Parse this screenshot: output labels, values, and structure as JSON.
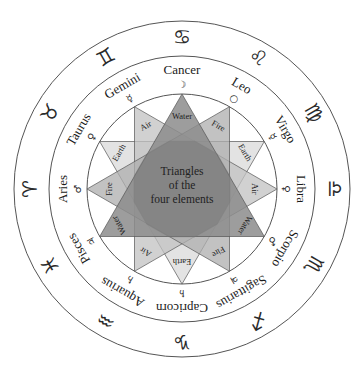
{
  "diagram": {
    "center_title_lines": [
      "Triangles",
      "of the",
      "four elements"
    ],
    "colors": {
      "ring_stroke": "#555555",
      "water": "#8c8c8c",
      "fire": "#adadad",
      "air": "#c2c2c2",
      "earth": "#dadada",
      "overlap": "#7a7a7a"
    },
    "signs": [
      {
        "name": "Cancer",
        "planet": "☽",
        "zodiac": "♋",
        "angle": 0
      },
      {
        "name": "Leo",
        "planet": "○",
        "zodiac": "♌",
        "angle": 30
      },
      {
        "name": "Virgo",
        "planet": "☿",
        "zodiac": "♍",
        "angle": 60
      },
      {
        "name": "Libra",
        "planet": "♀",
        "zodiac": "♎",
        "angle": 90
      },
      {
        "name": "Scorpio",
        "planet": "♂",
        "zodiac": "♏",
        "angle": 120
      },
      {
        "name": "Sagittarius",
        "planet": "♃",
        "zodiac": "♐",
        "angle": 150
      },
      {
        "name": "Capricorn",
        "planet": "♄",
        "zodiac": "♑",
        "angle": 180
      },
      {
        "name": "Aquarius",
        "planet": "♄",
        "zodiac": "♒",
        "angle": 210
      },
      {
        "name": "Pisces",
        "planet": "♃",
        "zodiac": "♓",
        "angle": 240
      },
      {
        "name": "Aries",
        "planet": "♂",
        "zodiac": "♈",
        "angle": 270
      },
      {
        "name": "Taurus",
        "planet": "♀",
        "zodiac": "♉",
        "angle": 300
      },
      {
        "name": "Gemini",
        "planet": "☿",
        "zodiac": "♊",
        "angle": 330
      }
    ],
    "element_labels": [
      {
        "text": "Water",
        "angle": 0
      },
      {
        "text": "Fire",
        "angle": 30
      },
      {
        "text": "Earth",
        "angle": 60
      },
      {
        "text": "Air",
        "angle": 90
      },
      {
        "text": "Water",
        "angle": 120
      },
      {
        "text": "Fire",
        "angle": 150
      },
      {
        "text": "Earth",
        "angle": 180
      },
      {
        "text": "Air",
        "angle": 210
      },
      {
        "text": "Water",
        "angle": 240
      },
      {
        "text": "Fire",
        "angle": 270
      },
      {
        "text": "Earth",
        "angle": 300
      },
      {
        "text": "Air",
        "angle": 330
      }
    ],
    "triangles": [
      {
        "element": "Water",
        "angles": [
          0,
          120,
          240
        ]
      },
      {
        "element": "Fire",
        "angles": [
          30,
          150,
          270
        ]
      },
      {
        "element": "Earth",
        "angles": [
          60,
          180,
          300
        ]
      },
      {
        "element": "Air",
        "angles": [
          90,
          210,
          330
        ]
      }
    ]
  }
}
